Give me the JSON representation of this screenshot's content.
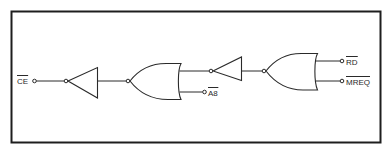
{
  "diagram": {
    "type": "logic-circuit",
    "signals": {
      "ce": {
        "name": "CE",
        "active_low": true,
        "direction": "input"
      },
      "a8": {
        "name": "A8",
        "active_low": true,
        "direction": "output"
      },
      "rd": {
        "name": "RD",
        "active_low": true,
        "direction": "output"
      },
      "mreq": {
        "name": "MREQ",
        "active_low": true,
        "direction": "output"
      }
    },
    "gates": [
      {
        "id": "inverter-1",
        "kind": "NOT"
      },
      {
        "id": "or-gate-1",
        "kind": "OR (inverted output, drawn right-to-left)"
      },
      {
        "id": "inverter-2",
        "kind": "NOT"
      },
      {
        "id": "or-gate-2",
        "kind": "OR (inverted output, drawn right-to-left)"
      }
    ],
    "connections": [
      "CE -> inverter-1",
      "inverter-1 -> or-gate-1",
      "or-gate-1 input A -> inverter-2",
      "or-gate-1 input B -> A8",
      "inverter-2 -> or-gate-2",
      "or-gate-2 input A -> RD",
      "or-gate-2 input B -> MREQ"
    ]
  }
}
